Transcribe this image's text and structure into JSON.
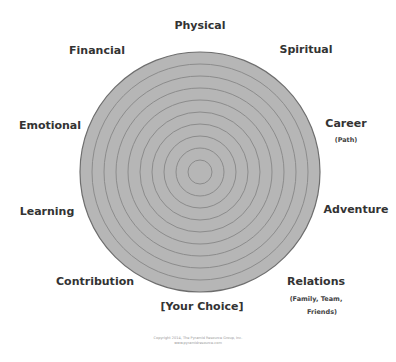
{
  "wheel": {
    "center_x": 200,
    "center_y": 172,
    "radius": 120,
    "ring_count": 10,
    "fill_color": "#b6b6b6",
    "ring_color": "#8c8c8c",
    "outline_color": "#6e6e6e"
  },
  "categories": {
    "physical": {
      "label": "Physical"
    },
    "spiritual": {
      "label": "Spiritual"
    },
    "career": {
      "label": "Career",
      "sublabel": "(Path)"
    },
    "adventure": {
      "label": "Adventure"
    },
    "relations": {
      "label": "Relations",
      "sublabel_1": "(Family, Team,",
      "sublabel_2": "Friends)"
    },
    "your_choice": {
      "label": "[Your Choice]"
    },
    "contribution": {
      "label": "Contribution"
    },
    "learning": {
      "label": "Learning"
    },
    "emotional": {
      "label": "Emotional"
    },
    "financial": {
      "label": "Financial"
    }
  },
  "footer": {
    "copyright_line_1": "Copyright 2014, The Pyramid Resource Group, Inc.",
    "copyright_line_2": "www.pyramidresource.com"
  }
}
